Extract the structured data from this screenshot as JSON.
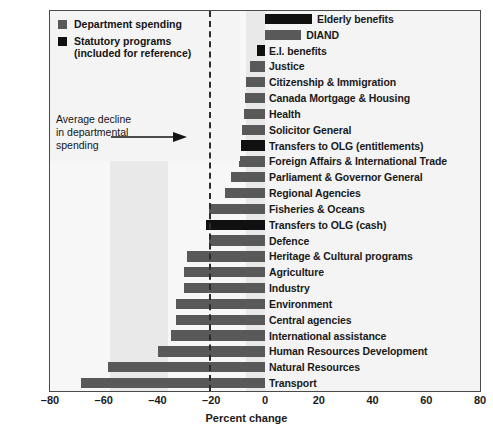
{
  "chart_data": {
    "type": "bar",
    "orientation": "horizontal",
    "title": "",
    "xlabel": "Percent change",
    "ylabel": "",
    "xlim": [
      -80,
      80
    ],
    "xticks": [
      -80,
      -60,
      -40,
      -20,
      0,
      20,
      40,
      60,
      80
    ],
    "xticklabels": [
      "–80",
      "–60",
      "–40",
      "–20",
      "0",
      "20",
      "40",
      "60",
      "80"
    ],
    "grid": false,
    "legend_position": "top-left",
    "categories": [
      "Elderly benefits",
      "DIAND",
      "E.I. benefits",
      "Justice",
      "Citizenship & Immigration",
      "Canada Mortgage & Housing",
      "Health",
      "Solicitor General",
      "Transfers to OLG (entitlements)",
      "Foreign Affairs & International Trade",
      "Parliament & Governor General",
      "Regional Agencies",
      "Fisheries & Oceans",
      "Transfers to OLG (cash)",
      "Defence",
      "Heritage & Cultural programs",
      "Agriculture",
      "Industry",
      "Environment",
      "Central agencies",
      "International assistance",
      "Human Resources Development",
      "Natural Resources",
      "Transport"
    ],
    "values": [
      17.5,
      13.5,
      -3,
      -5.5,
      -7,
      -7.5,
      -7.7,
      -8.4,
      -9,
      -9.5,
      -12.5,
      -15,
      -21,
      -22,
      -21,
      -29,
      -30,
      -30,
      -33,
      -33,
      -35,
      -40,
      -58.5,
      -68.5
    ],
    "series_type": [
      "statutory",
      "department",
      "statutory",
      "department",
      "department",
      "department",
      "department",
      "department",
      "statutory",
      "department",
      "department",
      "department",
      "department",
      "statutory",
      "department",
      "department",
      "department",
      "department",
      "department",
      "department",
      "department",
      "department",
      "department",
      "department"
    ],
    "reference_line": {
      "value": -20.7,
      "style": "dashed",
      "label": "Average decline in departmental spending"
    },
    "legend": [
      {
        "key": "department",
        "label": "Department spending",
        "color": "#595959"
      },
      {
        "key": "statutory",
        "label": "Statutory programs\n(included for reference)",
        "color": "#101010"
      }
    ]
  },
  "legend": {
    "items": [
      {
        "label": "Department spending",
        "color": "#595959"
      },
      {
        "label_line1": "Statutory programs",
        "label_line2": "(included for reference)",
        "color": "#101010"
      }
    ]
  },
  "annotation": {
    "line1": "Average decline",
    "line2": "in departmental",
    "line3": "spending"
  },
  "axis": {
    "title": "Percent change"
  },
  "caption": {
    "text": ""
  },
  "colors": {
    "department": "#595959",
    "statutory": "#101010",
    "plot_background": "#f2f2f2",
    "frame": "#4a4a4a"
  }
}
